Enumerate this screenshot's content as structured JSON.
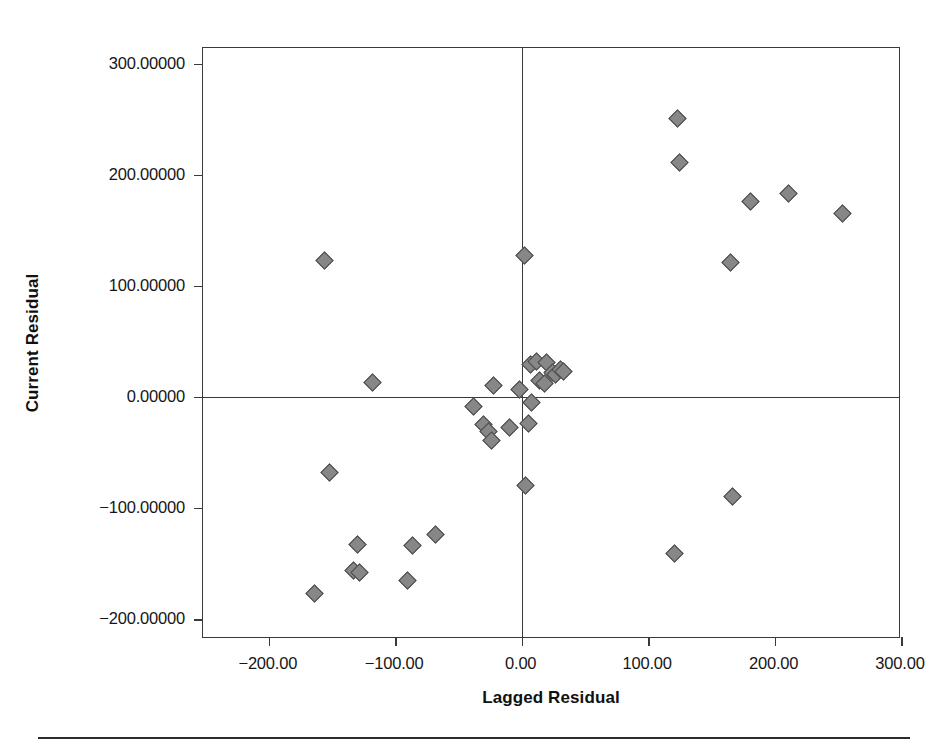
{
  "chart_data": {
    "type": "scatter",
    "title": "",
    "subtitle": "",
    "xlabel": "Lagged Residual",
    "ylabel": "Current Residual",
    "xlim": [
      -252,
      300
    ],
    "ylim": [
      -218,
      314
    ],
    "xticks": [
      -200,
      -100,
      0,
      100,
      200,
      300
    ],
    "xtick_labels": [
      "-200.00",
      "-100.00",
      "0.00",
      "100.00",
      "200.00",
      "300.00"
    ],
    "yticks": [
      300,
      200,
      100,
      0,
      -100,
      -200
    ],
    "ytick_labels": [
      "300.00000",
      "200.00000",
      "100.00000",
      "0.00000",
      "-100.00000",
      "-200.00000"
    ],
    "grid": false,
    "legend": null,
    "marker": {
      "shape": "diamond",
      "fill_color": "#878787",
      "edge_color": "#4a4a4a",
      "size_px": 13
    },
    "reference_lines": [
      {
        "axis": "x",
        "value": 0,
        "color": "#3a3a3a"
      },
      {
        "axis": "y",
        "value": 0,
        "color": "#3a3a3a"
      }
    ],
    "points": [
      {
        "x": -164,
        "y": -177
      },
      {
        "x": -156,
        "y": 123
      },
      {
        "x": -152,
        "y": -68
      },
      {
        "x": -133,
        "y": -156
      },
      {
        "x": -130,
        "y": -133
      },
      {
        "x": -128,
        "y": -158
      },
      {
        "x": -118,
        "y": 13
      },
      {
        "x": -90,
        "y": -165
      },
      {
        "x": -86,
        "y": -134
      },
      {
        "x": -68,
        "y": -124
      },
      {
        "x": -38,
        "y": -9
      },
      {
        "x": -30,
        "y": -25
      },
      {
        "x": -26,
        "y": -31
      },
      {
        "x": -24,
        "y": -39
      },
      {
        "x": -22,
        "y": 10
      },
      {
        "x": -10,
        "y": -28
      },
      {
        "x": -2,
        "y": 7
      },
      {
        "x": 2,
        "y": 127
      },
      {
        "x": 3,
        "y": -80
      },
      {
        "x": 5,
        "y": -24
      },
      {
        "x": 7,
        "y": 29
      },
      {
        "x": 8,
        "y": -5
      },
      {
        "x": 12,
        "y": 32
      },
      {
        "x": 14,
        "y": 15
      },
      {
        "x": 18,
        "y": 12
      },
      {
        "x": 20,
        "y": 31
      },
      {
        "x": 24,
        "y": 22
      },
      {
        "x": 27,
        "y": 20
      },
      {
        "x": 31,
        "y": 25
      },
      {
        "x": 33,
        "y": 23
      },
      {
        "x": 121,
        "y": -141
      },
      {
        "x": 123,
        "y": 251
      },
      {
        "x": 125,
        "y": 211
      },
      {
        "x": 165,
        "y": 121
      },
      {
        "x": 167,
        "y": -90
      },
      {
        "x": 181,
        "y": 176
      },
      {
        "x": 211,
        "y": 183
      },
      {
        "x": 254,
        "y": 165
      }
    ]
  }
}
